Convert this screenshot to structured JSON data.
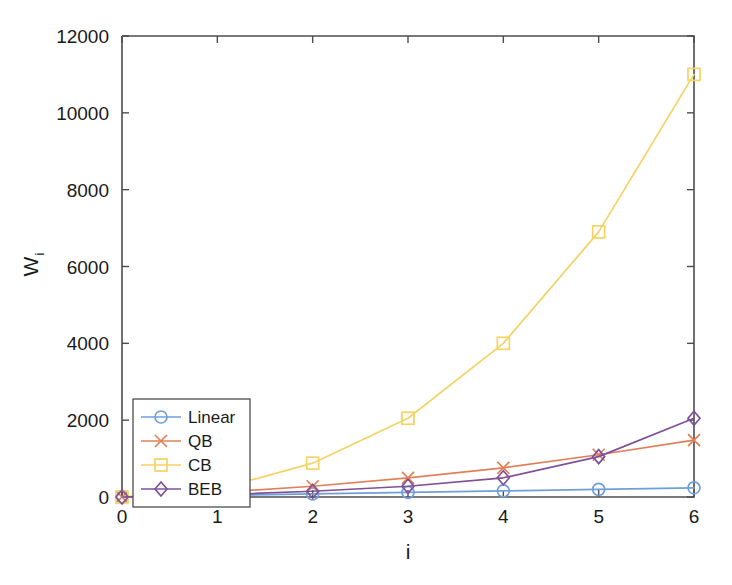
{
  "chart_data": {
    "type": "line",
    "title": "",
    "xlabel": "i",
    "ylabel": "W",
    "ylabel_subscript": "i",
    "x": [
      0,
      1,
      2,
      3,
      4,
      5,
      6
    ],
    "xlim": [
      0,
      6
    ],
    "ylim": [
      0,
      12000
    ],
    "xticks": [
      "0",
      "1",
      "2",
      "3",
      "4",
      "5",
      "6"
    ],
    "yticks": [
      "0",
      "2000",
      "4000",
      "6000",
      "8000",
      "10000",
      "12000"
    ],
    "grid": false,
    "legend_position": "lower left",
    "series": [
      {
        "name": "Linear",
        "color": "#6f9fd8",
        "marker": "circle",
        "values": [
          0,
          40,
          80,
          120,
          160,
          200,
          240
        ]
      },
      {
        "name": "QB",
        "color": "#e0805a",
        "marker": "x",
        "values": [
          0,
          120,
          280,
          500,
          760,
          1100,
          1480
        ]
      },
      {
        "name": "CB",
        "color": "#f5d264",
        "marker": "square",
        "values": [
          0,
          200,
          880,
          2050,
          4000,
          6900,
          11000
        ]
      },
      {
        "name": "BEB",
        "color": "#7f5098",
        "marker": "diamond",
        "values": [
          0,
          60,
          150,
          280,
          500,
          1050,
          2050
        ]
      }
    ]
  },
  "axes": {
    "x_axis_name": "x-axis",
    "y_axis_name": "y-axis"
  }
}
